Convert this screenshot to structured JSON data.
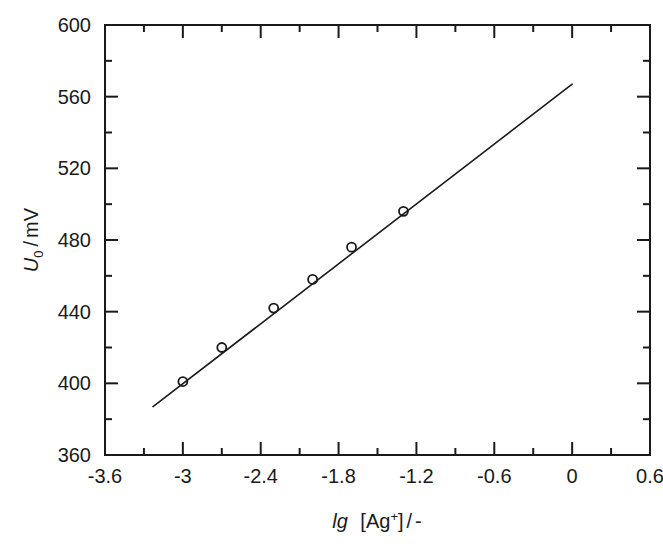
{
  "figure": {
    "background_color": "#ffffff",
    "foreground_color": "#1a1a1a"
  },
  "axes": {
    "x": {
      "title_parts": {
        "symbol": "lg",
        "bracket_open": "[Ag",
        "charge": "+",
        "bracket_close": "]",
        "separator": "/",
        "unit": "-"
      },
      "title_plain": "lg [Ag+] / -",
      "min": -3.6,
      "max": 0.6,
      "major_step": 0.6,
      "minor_step": 0.3,
      "tick_labels": [
        "-3.6",
        "-3",
        "-2.4",
        "-1.8",
        "-1.2",
        "-0.6",
        "0",
        "0.6"
      ],
      "tick_values": [
        -3.6,
        -3.0,
        -2.4,
        -1.8,
        -1.2,
        -0.6,
        0.0,
        0.6
      ]
    },
    "y": {
      "title_parts": {
        "symbol": "U",
        "subscript": "0",
        "separator": "/",
        "unit": "mV"
      },
      "title_plain": "U0 / mV",
      "min": 360,
      "max": 600,
      "major_step": 40,
      "minor_step": 20,
      "tick_labels": [
        "360",
        "400",
        "440",
        "480",
        "520",
        "560",
        "600"
      ],
      "tick_values": [
        360,
        400,
        440,
        480,
        520,
        560,
        600
      ]
    },
    "ticks_direction": "inward",
    "frame": "full-box",
    "grid": false
  },
  "chart_data": {
    "type": "scatter",
    "title": "",
    "subtitle": "",
    "xlabel": "lg [Ag+] / -",
    "ylabel": "U0 / mV",
    "xlim": [
      -3.6,
      0.6
    ],
    "ylim": [
      360,
      600
    ],
    "grid": false,
    "legend": null,
    "series": [
      {
        "name": "measured potential",
        "marker": "open-circle",
        "marker_size": 9,
        "color": "#1a1a1a",
        "x": [
          -3.0,
          -2.7,
          -2.3,
          -2.0,
          -1.7,
          -1.3
        ],
        "y": [
          401,
          420,
          442,
          458,
          476,
          496
        ],
        "points": [
          {
            "x": -3.0,
            "y": 401
          },
          {
            "x": -2.7,
            "y": 420
          },
          {
            "x": -2.3,
            "y": 442
          },
          {
            "x": -2.0,
            "y": 458
          },
          {
            "x": -1.7,
            "y": 476
          },
          {
            "x": -1.3,
            "y": 496
          }
        ]
      },
      {
        "name": "linear fit",
        "marker": "none",
        "line_style": "solid",
        "color": "#1a1a1a",
        "x": [
          -3.23,
          0.0
        ],
        "y": [
          387,
          567
        ],
        "slope": 55.7,
        "intercept": 567
      }
    ]
  },
  "annotations": []
}
